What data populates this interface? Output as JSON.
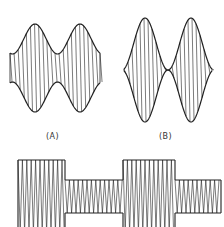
{
  "figure": {
    "panels": [
      {
        "id": "A",
        "label": "(A)",
        "description": "Amplitude-modulated carrier, moderate modulation depth",
        "envelope": {
          "x_start": 10,
          "x_end": 100,
          "center_y": 68,
          "max_half_amp": 44,
          "min_half_amp": 14,
          "peaks_x": [
            35,
            80
          ]
        },
        "carrier_cycles": 22
      },
      {
        "id": "B",
        "label": "(B)",
        "description": "Amplitude-modulated carrier, full (100%) modulation depth",
        "envelope": {
          "x_start": 124,
          "x_end": 212,
          "center_y": 70,
          "max_half_amp": 52,
          "min_half_amp": 0,
          "peaks_x": [
            145,
            191
          ]
        },
        "carrier_cycles": 22
      },
      {
        "id": "C",
        "label": "",
        "description": "Square-wave amplitude keyed carrier",
        "segments": [
          {
            "x_start": 18,
            "x_end": 65,
            "level": "high"
          },
          {
            "x_start": 65,
            "x_end": 123,
            "level": "low"
          },
          {
            "x_start": 123,
            "x_end": 175,
            "level": "high"
          },
          {
            "x_start": 175,
            "x_end": 221,
            "level": "low"
          }
        ],
        "high_top": 160,
        "high_bottom": 232,
        "low_top": 180,
        "low_bottom": 213,
        "carrier_period": 4.4
      }
    ],
    "stroke_color": "#222222"
  }
}
